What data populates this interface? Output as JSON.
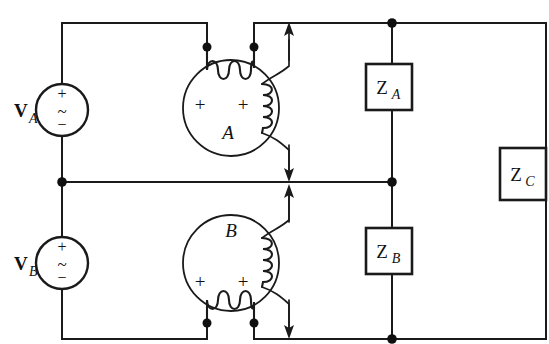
{
  "diagram": {
    "type": "electrical-schematic",
    "background_color": "#ffffff",
    "line_color": "#1a1a1a"
  },
  "sources": [
    {
      "id": "source-a",
      "label": "V",
      "subscript": "A",
      "plus_symbol": "+",
      "minus_symbol": "−",
      "wave_symbol": "~",
      "kind": "ac-voltage-source",
      "cx": 62,
      "cy": 110,
      "r": 26
    },
    {
      "id": "source-b",
      "label": "V",
      "subscript": "B",
      "plus_symbol": "+",
      "minus_symbol": "−",
      "wave_symbol": "~",
      "kind": "ac-voltage-source",
      "cx": 62,
      "cy": 263,
      "r": 26
    }
  ],
  "machines": [
    {
      "id": "machine-a",
      "label": "A",
      "terminal_plus_left": "+",
      "terminal_plus_right": "+",
      "cx": 231,
      "cy": 108,
      "r": 48
    },
    {
      "id": "machine-b",
      "label": "B",
      "terminal_plus_left": "+",
      "terminal_plus_right": "+",
      "cx": 231,
      "cy": 263,
      "r": 48
    }
  ],
  "impedances": [
    {
      "id": "impedance-a",
      "label": "Z",
      "subscript": "A",
      "x": 366,
      "y": 64,
      "w": 46,
      "h": 46
    },
    {
      "id": "impedance-b",
      "label": "Z",
      "subscript": "B",
      "x": 366,
      "y": 228,
      "w": 46,
      "h": 46
    },
    {
      "id": "impedance-c",
      "label": "Z",
      "subscript": "C",
      "x": 500,
      "y": 148,
      "w": 46,
      "h": 52
    }
  ],
  "nodes": [
    {
      "id": "node-machine-a-left",
      "x": 207,
      "y": 47
    },
    {
      "id": "node-machine-a-right",
      "x": 254,
      "y": 47
    },
    {
      "id": "node-machine-b-left",
      "x": 207,
      "y": 323
    },
    {
      "id": "node-machine-b-right",
      "x": 254,
      "y": 323
    },
    {
      "id": "node-left-mid",
      "x": 62,
      "y": 182
    },
    {
      "id": "node-right-top",
      "x": 392,
      "y": 23
    },
    {
      "id": "node-right-mid",
      "x": 392,
      "y": 182
    },
    {
      "id": "node-right-bottom",
      "x": 392,
      "y": 339
    }
  ],
  "current_arrows": [
    {
      "id": "arrow-a-up",
      "direction": "up",
      "x": 289,
      "y_tip": 23
    },
    {
      "id": "arrow-a-down",
      "direction": "down",
      "x": 289,
      "y_tip": 180
    },
    {
      "id": "arrow-b-up",
      "direction": "up",
      "x": 289,
      "y_tip": 184
    },
    {
      "id": "arrow-b-down",
      "direction": "down",
      "x": 289,
      "y_tip": 339
    }
  ]
}
